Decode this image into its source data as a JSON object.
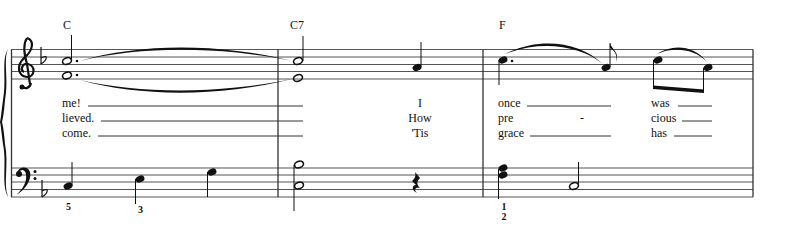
{
  "score": {
    "key_signature": "F major (one flat)",
    "clefs": [
      "treble",
      "bass"
    ],
    "measures": [
      {
        "chord": "C",
        "lyrics": [
          "me!",
          "lieved.",
          "come."
        ],
        "treble": "dotted half chord E4+G4 (tied)",
        "bass": [
          "C3 quarter",
          "E3 quarter",
          "G3 quarter"
        ],
        "fingering": [
          "5",
          "3"
        ]
      },
      {
        "chord": "C7",
        "lyrics": [
          "I",
          "How",
          "'Tis"
        ],
        "treble": "half chord E4+G4, quarter F4",
        "bass": [
          "half chord C3+Bb3",
          "quarter rest"
        ]
      },
      {
        "chord": "F",
        "lyrics": [
          [
            "once",
            "was"
          ],
          [
            "pre",
            "-",
            "cious"
          ],
          [
            "grace",
            "has"
          ]
        ],
        "treble": "dotted quarter A4, eighth F4, eighths A4 G4",
        "bass": [
          "quarter chord F3+A3",
          "half C3"
        ],
        "fingering": [
          "1",
          "2"
        ]
      }
    ]
  },
  "chords": {
    "m1": "C",
    "m2": "C7",
    "m3": "F"
  },
  "lyrics": {
    "m1": {
      "v1": "me!",
      "v2": "lieved.",
      "v3": "come."
    },
    "m2": {
      "v1": "I",
      "v2": "How",
      "v3": "'Tis"
    },
    "m3a": {
      "v1": "once",
      "v2": "pre",
      "v3": "grace"
    },
    "m3hyphen": "-",
    "m3b": {
      "v1": "was",
      "v2": "cious",
      "v3": "has"
    }
  },
  "fingering": {
    "m1_c": "5",
    "m1_e": "3",
    "m3_top": "1",
    "m3_bottom": "2"
  },
  "colors": {
    "ink": "#111111",
    "staff": "#555555",
    "background": "#ffffff"
  }
}
